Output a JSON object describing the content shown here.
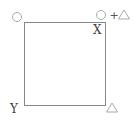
{
  "diagram": {
    "type": "square-with-corner-markers",
    "square": {
      "x": 24,
      "y": 22,
      "width": 81,
      "height": 83,
      "stroke": "#888888"
    },
    "labels": {
      "top_right_inside": "X",
      "bottom_left_outside": "Y",
      "plus": "+"
    },
    "markers": [
      {
        "name": "circle-top-left",
        "shape": "circle",
        "cx": 17,
        "cy": 17,
        "r": 4
      },
      {
        "name": "circle-top-right",
        "shape": "circle",
        "cx": 101,
        "cy": 15,
        "r": 4
      },
      {
        "name": "triangle-top-right",
        "shape": "triangle",
        "cx": 124,
        "cy": 15
      },
      {
        "name": "triangle-bottom-right",
        "shape": "triangle",
        "cx": 112,
        "cy": 108
      }
    ],
    "colors": {
      "stroke": "#888888",
      "marker": "#aaaaaa",
      "text": "#444444"
    }
  }
}
